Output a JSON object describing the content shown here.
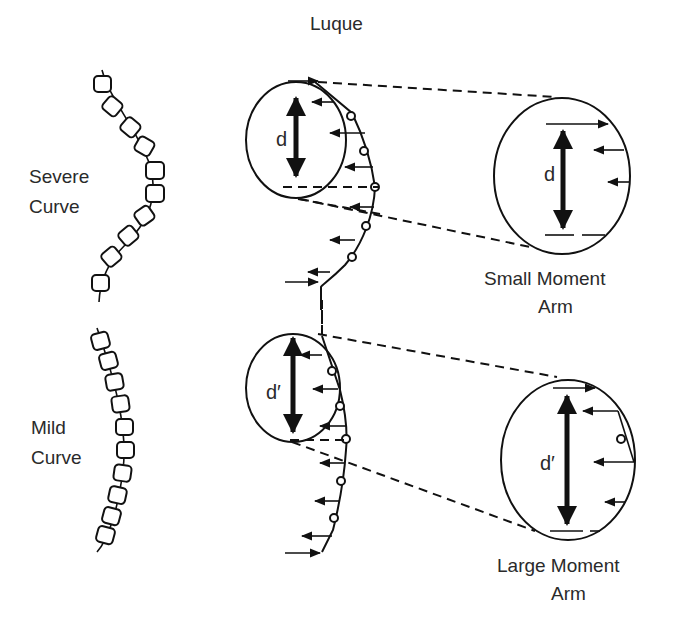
{
  "title": "Luque",
  "colors": {
    "ink": "#111111",
    "text": "#2a2a2a",
    "background": "#ffffff"
  },
  "panels": {
    "severe": {
      "label_line1": "Severe",
      "label_line2": "Curve",
      "dimension_label": "d",
      "callout_line1": "Small Moment",
      "callout_line2": "Arm",
      "callout_dimension_label": "d"
    },
    "mild": {
      "label_line1": "Mild",
      "label_line2": "Curve",
      "dimension_label": "d′",
      "callout_line1": "Large Moment",
      "callout_line2": "Arm",
      "callout_dimension_label": "d′"
    }
  },
  "icons": {
    "vertebra": "rounded-square",
    "wire_loop": "small-circle",
    "force_arrow": "arrow-left",
    "dimension_arrow": "double-headed-arrow"
  }
}
